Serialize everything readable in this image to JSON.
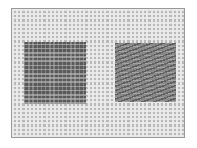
{
  "image": {
    "subject": "needlepoint canvas with two stitched square samples",
    "samples": [
      {
        "position": "left",
        "texture": "grid-like tent stitch",
        "tone": "#5a5a5a"
      },
      {
        "position": "right",
        "texture": "diagonal slanted stitch",
        "tone": "#8a8a8a"
      }
    ],
    "colors": {
      "background": "#ffffff",
      "canvas": "#b9b9b9",
      "canvas_thread": "#ebebeb",
      "border": "#9a9a9a"
    }
  }
}
